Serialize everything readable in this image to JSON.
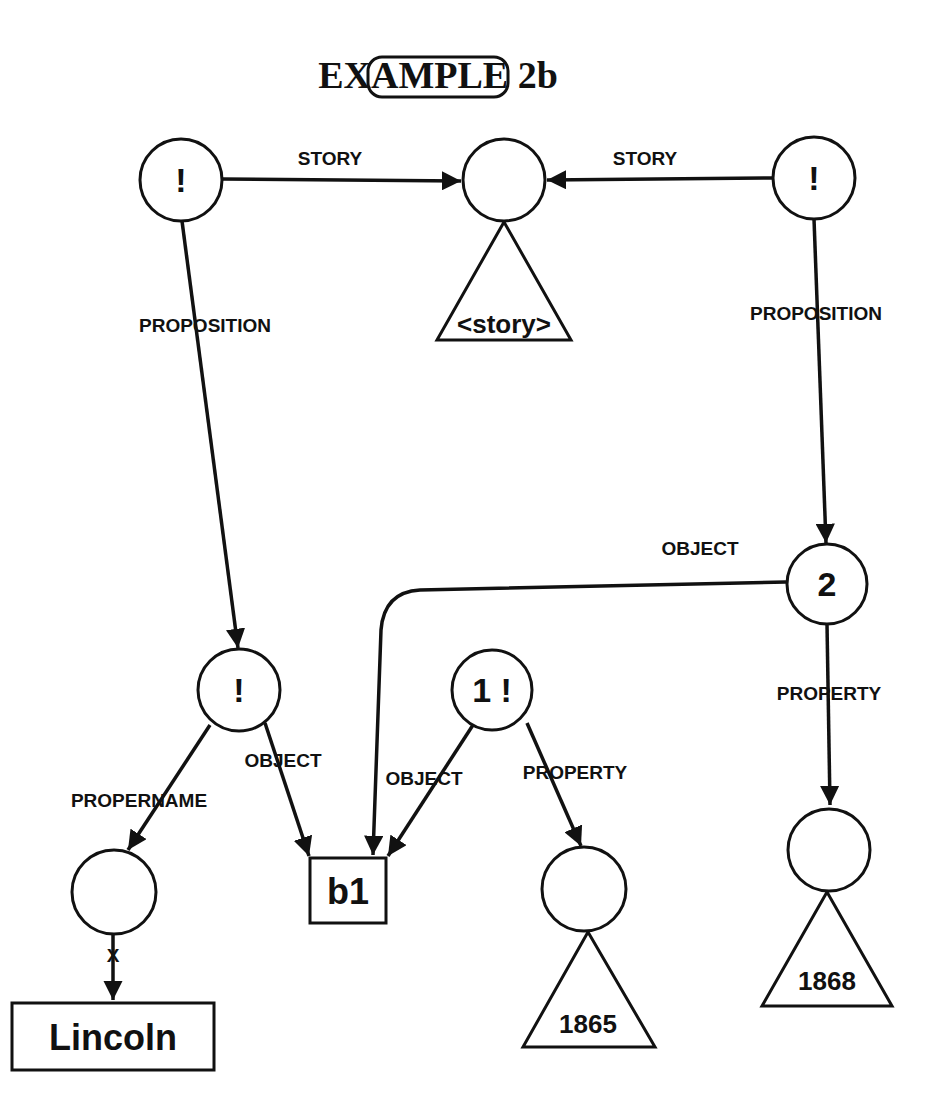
{
  "title": "EXAMPLE 2b",
  "nodes": {
    "top_left": {
      "label": "!"
    },
    "story": {
      "label": "",
      "subtree": "<story>"
    },
    "top_right": {
      "label": "!"
    },
    "prop2": {
      "label": "2"
    },
    "mid_left": {
      "label": "!"
    },
    "prop1": {
      "label": "1 !"
    },
    "name_node": {
      "label": ""
    },
    "lincoln": {
      "label": "Lincoln"
    },
    "b1": {
      "label": "b1"
    },
    "val1865": {
      "label": "",
      "subtree": "1865"
    },
    "val1868": {
      "label": "",
      "subtree": "1868"
    }
  },
  "edges": {
    "story_left": "STORY",
    "story_right": "STORY",
    "proposition_left": "PROPOSITION",
    "proposition_right": "PROPOSITION",
    "object_from_2": "OBJECT",
    "property_from_2": "PROPERTY",
    "propername": "PROPERNAME",
    "object_mid": "OBJECT",
    "object_from_1": "OBJECT",
    "property_from_1": "PROPERTY",
    "lex_marker": "X"
  }
}
